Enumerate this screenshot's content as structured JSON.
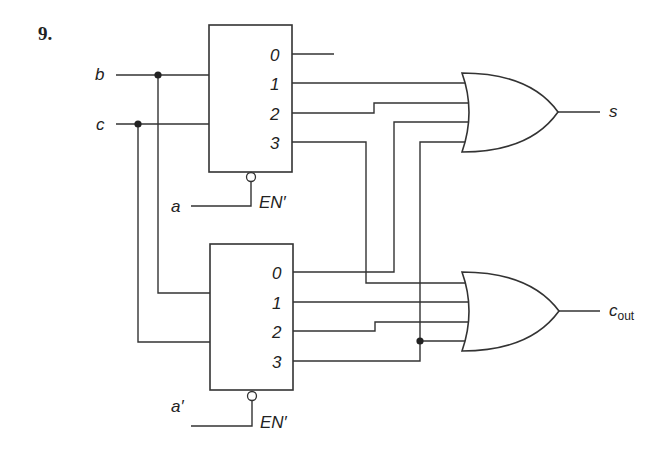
{
  "problem_number": "9.",
  "inputs": {
    "b": "b",
    "c": "c",
    "a": "a",
    "a_prime": "a′"
  },
  "decoders": [
    {
      "name": "top-decoder",
      "outputs": [
        "0",
        "1",
        "2",
        "3"
      ],
      "enable_label": "EN′"
    },
    {
      "name": "bottom-decoder",
      "outputs": [
        "0",
        "1",
        "2",
        "3"
      ],
      "enable_label": "EN′"
    }
  ],
  "outputs": {
    "s": "s",
    "cout_main": "c",
    "cout_sub": "out"
  }
}
